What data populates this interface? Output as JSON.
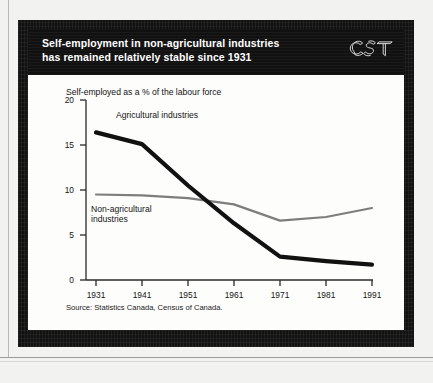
{
  "document": {
    "logo_text": "CST",
    "logo_name": "cst-logo"
  },
  "header": {
    "title_line1": "Self-employment in non-agricultural industries",
    "title_line2": "has remained relatively stable since 1931"
  },
  "chart_data": {
    "type": "line",
    "title": "Self-employment in non-agricultural industries has remained relatively stable since 1931",
    "subtitle": "Self-employed as a % of the labour force",
    "xlabel": "",
    "ylabel": "",
    "x": [
      1931,
      1941,
      1951,
      1961,
      1971,
      1981,
      1991
    ],
    "categories": [
      "1931",
      "1941",
      "1951",
      "1961",
      "1971",
      "1981",
      "1991"
    ],
    "xtick_labels": [
      "1931",
      "1941",
      "1951",
      "1961",
      "1971",
      "1981",
      "1991"
    ],
    "ytick_labels": [
      "0",
      "5",
      "10",
      "15",
      "20"
    ],
    "yticks": [
      0,
      5,
      10,
      15,
      20
    ],
    "ylim": [
      0,
      20
    ],
    "xlim": [
      1931,
      1991
    ],
    "grid": false,
    "legend": "inline-annotations",
    "series": [
      {
        "name": "Agricultural industries",
        "label": "Agricultural industries",
        "color": "#111111",
        "line_width": "thick",
        "values": [
          16.4,
          15.1,
          10.5,
          6.3,
          2.6,
          2.1,
          1.7
        ]
      },
      {
        "name": "Non-agricultural industries",
        "label_line1": "Non-agricultural",
        "label_line2": "industries",
        "label": "Non-agricultural industries",
        "color": "#7d7d7d",
        "line_width": "thin",
        "values": [
          9.5,
          9.4,
          9.1,
          8.4,
          6.6,
          7.0,
          8.0
        ]
      }
    ],
    "annotations": [
      {
        "text": "Agricultural industries",
        "series": "Agricultural industries"
      },
      {
        "text": "Non-agricultural industries",
        "series": "Non-agricultural industries"
      }
    ],
    "source": "Source: Statistics Canada, Census of Canada."
  },
  "footer": {
    "source": "Source: Statistics Canada, Census of Canada."
  },
  "colors": {
    "frame": "#121212",
    "title_band": "#111111",
    "card": "#fdfdfb",
    "page": "#f2f2f0",
    "agricultural_line": "#111111",
    "nonagricultural_line": "#7d7d7d",
    "axis": "#2a2a2a"
  }
}
